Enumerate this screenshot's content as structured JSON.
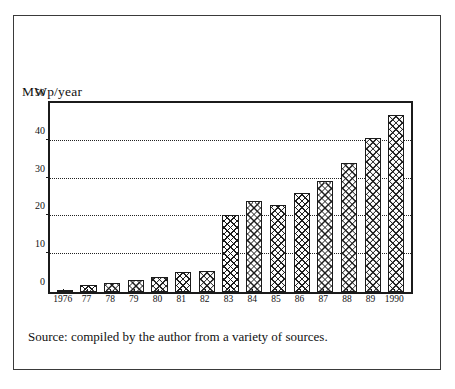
{
  "figure": {
    "source_note": "Source: compiled by the author from a variety of sources.",
    "axis_title": "MWp/year"
  },
  "chart_data": {
    "type": "bar",
    "title": "",
    "subtitle": "",
    "xlabel": "",
    "ylabel": "MWp/year",
    "ylim": [
      0,
      50
    ],
    "yticks": [
      0,
      10,
      20,
      30,
      40,
      50
    ],
    "ytick_labels": [
      "0",
      "10",
      "20",
      "30",
      "40",
      "50"
    ],
    "grid": "horizontal-dotted",
    "legend": "none",
    "categories": [
      "1976",
      "77",
      "78",
      "79",
      "80",
      "81",
      "82",
      "83",
      "84",
      "85",
      "86",
      "87",
      "88",
      "89",
      "1990"
    ],
    "values": [
      0.4,
      1.8,
      2.3,
      3.3,
      4.0,
      5.3,
      5.6,
      20.3,
      24.2,
      23.0,
      26.2,
      29.5,
      34.2,
      40.7,
      46.8
    ],
    "bar_style": "white with black cross-hatch, black outline",
    "annotations": [
      "Source: compiled by the author from a variety of sources."
    ]
  },
  "colors": {
    "ink": "#1b1b1b",
    "frame": "#3a3a3a",
    "background": "#ffffff"
  }
}
